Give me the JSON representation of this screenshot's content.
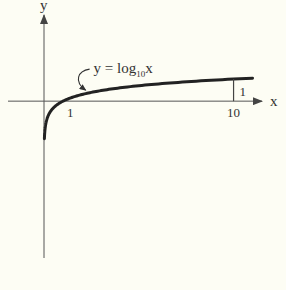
{
  "chart_data": {
    "type": "line",
    "title": "",
    "function": "y = log10(x)",
    "xlabel": "x",
    "ylabel": "y",
    "series": [
      {
        "name": "y = log10x",
        "x": [
          0.02,
          0.05,
          0.1,
          0.2,
          0.3,
          0.5,
          0.7,
          1,
          1.5,
          2,
          3,
          4,
          5,
          6,
          7,
          8,
          9,
          10,
          11
        ],
        "values": [
          -1.699,
          -1.301,
          -1.0,
          -0.699,
          -0.523,
          -0.301,
          -0.155,
          0,
          0.176,
          0.301,
          0.477,
          0.602,
          0.699,
          0.778,
          0.845,
          0.903,
          0.954,
          1.0,
          1.041
        ]
      }
    ],
    "x_ticks": [
      {
        "value": 1,
        "label": "1"
      },
      {
        "value": 10,
        "label": "10"
      }
    ],
    "annotations": [
      {
        "text": "y = log",
        "subscript": "10",
        "suffix": "x",
        "points_to_x": 2.3
      },
      {
        "text": "1",
        "note": "height of curve at x = 10",
        "x": 10,
        "y": 1
      }
    ],
    "xlim": [
      -1.9,
      11.5
    ],
    "ylim": [
      -7.1,
      3.9
    ],
    "grid": false,
    "legend": "none",
    "colors": {
      "curve": "#222222",
      "axes": "#555555",
      "background": "#fdfdf4"
    }
  }
}
